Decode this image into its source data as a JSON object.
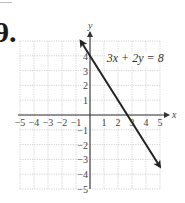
{
  "problem": {
    "number": "9."
  },
  "chart_data": {
    "type": "line",
    "title": "",
    "xlabel": "x",
    "ylabel": "y",
    "xlim": [
      -5,
      5
    ],
    "ylim": [
      -5,
      5
    ],
    "grid": true,
    "x_ticks": [
      "-5",
      "-4",
      "-3",
      "-2",
      "-1",
      "1",
      "2",
      "3",
      "4",
      "5"
    ],
    "y_ticks": [
      "4",
      "3",
      "2",
      "1",
      "-1",
      "-2",
      "-3",
      "-4",
      "-5"
    ],
    "series": [
      {
        "name": "3x + 2y = 8",
        "equation": "3x + 2y = 8",
        "x": [
          -0.67,
          5
        ],
        "y": [
          5,
          -3.5
        ],
        "arrows": "both"
      }
    ],
    "annotations": [
      {
        "text": "3x + 2y = 8",
        "x": 1.2,
        "y": 3.6
      }
    ]
  },
  "colors": {
    "line": "#222222",
    "grid": "#c8c8c8",
    "axis": "#333333"
  }
}
